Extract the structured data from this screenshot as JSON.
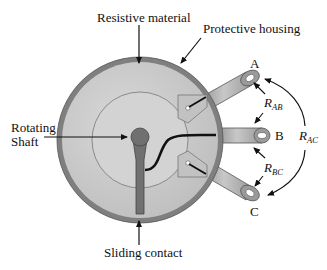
{
  "diagram": {
    "type": "potentiometer-cutaway",
    "labels": {
      "resistive_material": "Resistive material",
      "protective_housing": "Protective housing",
      "rotating_shaft_line1": "Rotating",
      "rotating_shaft_line2": "Shaft",
      "sliding_contact": "Sliding contact"
    },
    "terminals": [
      "A",
      "B",
      "C"
    ],
    "resistances": {
      "r_ab": {
        "main": "R",
        "sub": "AB"
      },
      "r_bc": {
        "main": "R",
        "sub": "BC"
      },
      "r_ac": {
        "main": "R",
        "sub": "AC"
      }
    },
    "colors": {
      "housing": "#7f7f7f",
      "resistive": "#c9c9c9",
      "inner_disk": "#d6d6d6",
      "shaft": "#707070",
      "wire": "#111111",
      "background": "#ffffff"
    }
  }
}
